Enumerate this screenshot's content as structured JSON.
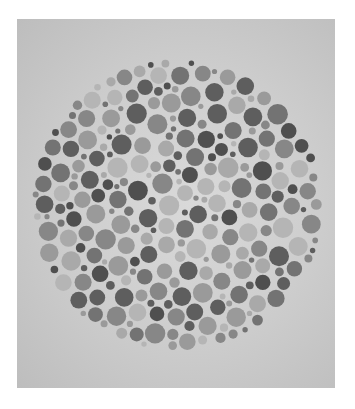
{
  "image": {
    "subject": "grayscale color-vision test plate (dot pattern)",
    "background_color": "#cfcfcf",
    "border_color": "#ffffff"
  },
  "plate": {
    "center": [
      160,
      186
    ],
    "radius": 146,
    "dot_colors": [
      "#4f4f4f",
      "#5e5e5e",
      "#737373",
      "#878787",
      "#9a9a9a",
      "#a9a9a9",
      "#b5b5b5"
    ],
    "seed": 7
  }
}
